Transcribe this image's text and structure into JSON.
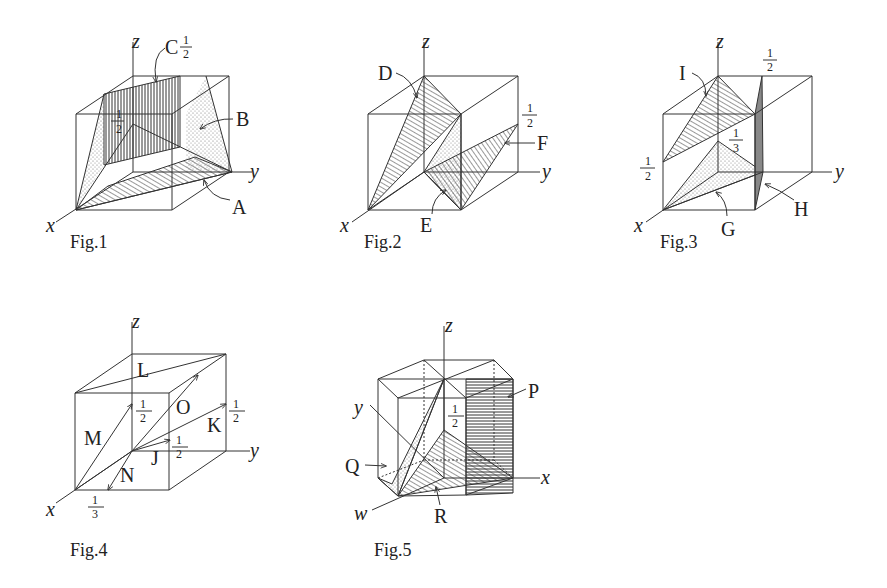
{
  "figures": [
    {
      "id": "fig1",
      "caption": "Fig.1",
      "axes": {
        "x": "x",
        "y": "y",
        "z": "z"
      },
      "planes": [
        {
          "label": "A",
          "fill": "hatch-diagonal"
        },
        {
          "label": "B",
          "fill": "dots"
        },
        {
          "label": "C",
          "fill": "hatch-vertical",
          "intercept": "1/2"
        }
      ],
      "intercepts": [
        "1/2",
        "1/2"
      ]
    },
    {
      "id": "fig2",
      "caption": "Fig.2",
      "axes": {
        "x": "x",
        "y": "y",
        "z": "z"
      },
      "planes": [
        {
          "label": "D",
          "fill": "hatch-diagonal"
        },
        {
          "label": "E",
          "fill": "dots"
        },
        {
          "label": "F",
          "fill": "hatch-diagonal"
        }
      ],
      "intercepts": [
        "1/2"
      ]
    },
    {
      "id": "fig3",
      "caption": "Fig.3",
      "axes": {
        "x": "x",
        "y": "y",
        "z": "z"
      },
      "planes": [
        {
          "label": "G",
          "fill": "dots"
        },
        {
          "label": "H",
          "fill": "solid-grey"
        },
        {
          "label": "I",
          "fill": "hatch-diagonal"
        }
      ],
      "intercepts": [
        "1/2",
        "1/2",
        "1/3"
      ]
    },
    {
      "id": "fig4",
      "caption": "Fig.4",
      "axes": {
        "x": "x",
        "y": "y",
        "z": "z"
      },
      "directions": [
        "J",
        "K",
        "L",
        "M",
        "N",
        "O"
      ],
      "intercepts": [
        "1/2",
        "1/2",
        "1/2",
        "1/3"
      ]
    },
    {
      "id": "fig5",
      "caption": "Fig.5",
      "axes": {
        "x": "x",
        "y": "y",
        "z": "z",
        "w": "w"
      },
      "planes": [
        {
          "label": "P",
          "fill": "hatch-horizontal"
        },
        {
          "label": "Q",
          "fill": "dots"
        },
        {
          "label": "R",
          "fill": "hatch-diagonal"
        }
      ],
      "intercepts": [
        "1/2"
      ]
    }
  ],
  "labels": {
    "x": "x",
    "y": "y",
    "z": "z",
    "w": "w",
    "half": "1",
    "two": "2",
    "three": "3",
    "A": "A",
    "B": "B",
    "C": "C",
    "D": "D",
    "E": "E",
    "F": "F",
    "G": "G",
    "H": "H",
    "I": "I",
    "J": "J",
    "K": "K",
    "L": "L",
    "M": "M",
    "N": "N",
    "O": "O",
    "P": "P",
    "Q": "Q",
    "R": "R",
    "fig1": "Fig.1",
    "fig2": "Fig.2",
    "fig3": "Fig.3",
    "fig4": "Fig.4",
    "fig5": "Fig.5"
  }
}
